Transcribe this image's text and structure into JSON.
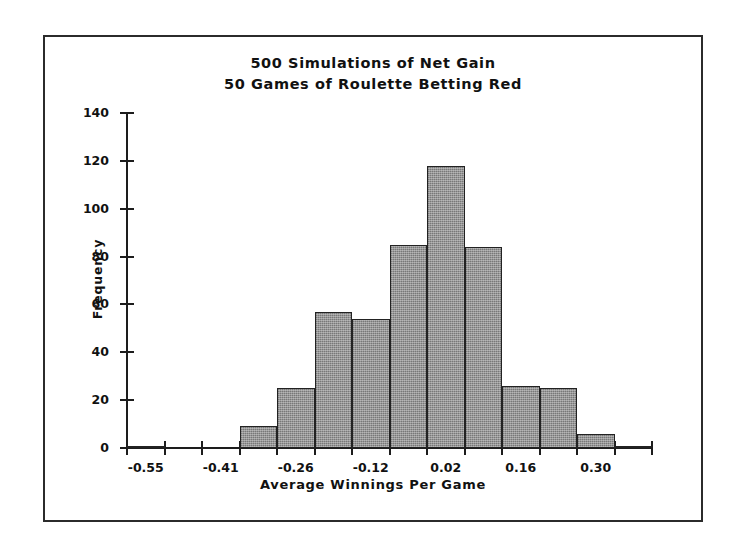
{
  "chart_data": {
    "type": "bar",
    "title": "500 Simulations of Net Gain\n50 Games of Roulette Betting Red",
    "title_line1": "500 Simulations of Net Gain",
    "title_line2": "50 Games of Roulette Betting Red",
    "xlabel": "Average Winnings Per Game",
    "ylabel": "Frequency",
    "ylim": [
      0,
      140
    ],
    "ytick_labels": [
      "0",
      "20",
      "40",
      "60",
      "80",
      "100",
      "120",
      "140"
    ],
    "ytick_values": [
      0,
      20,
      40,
      60,
      80,
      100,
      120,
      140
    ],
    "xtick_labels": [
      "-0.55",
      "-0.41",
      "-0.26",
      "-0.12",
      "0.02",
      "0.16",
      "0.30"
    ],
    "xtick_values": [
      -0.55,
      -0.41,
      -0.26,
      -0.12,
      0.02,
      0.16,
      0.3
    ],
    "xlim": [
      -0.62,
      0.4
    ],
    "grid": false,
    "legend": false,
    "bin_width": 0.0785,
    "bin_centers": [
      -0.55,
      -0.47,
      -0.41,
      -0.33,
      -0.26,
      -0.18,
      -0.12,
      -0.04,
      0.02,
      0.1,
      0.16,
      0.24,
      0.3,
      0.37
    ],
    "categories": [
      "-0.55",
      "-0.47",
      "-0.41",
      "-0.33",
      "-0.26",
      "-0.18",
      "-0.12",
      "-0.04",
      "0.02",
      "0.10",
      "0.16",
      "0.24",
      "0.30",
      "0.37"
    ],
    "values": [
      1,
      0,
      0,
      9,
      25,
      57,
      54,
      85,
      118,
      84,
      26,
      25,
      6,
      1
    ],
    "bar_fill_color": "#8a8a8a",
    "bar_edge_color": "#222222",
    "axis_color": "#1d1d1d",
    "background_color": "#ffffff",
    "frame_color": "#2b2b2b",
    "total_simulations": 500
  }
}
